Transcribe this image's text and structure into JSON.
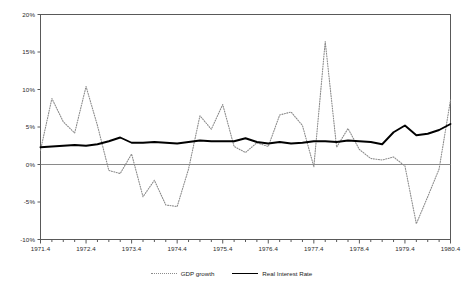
{
  "chart_data": {
    "type": "line",
    "title": "",
    "xlabel": "",
    "ylabel": "",
    "ylim": [
      -10,
      20
    ],
    "ytick_values": [
      -10,
      -5,
      0,
      5,
      10,
      15,
      20
    ],
    "ytick_labels": [
      "-10%",
      "-5%",
      "0%",
      "5%",
      "10%",
      "15%",
      "20%"
    ],
    "grid": false,
    "legend_position": "bottom-center",
    "zero_line": 0,
    "x": [
      "1971.4",
      "1972.1",
      "1972.2",
      "1972.3",
      "1972.4",
      "1973.1",
      "1973.2",
      "1973.3",
      "1973.4",
      "1974.1",
      "1974.2",
      "1974.3",
      "1974.4",
      "1975.1",
      "1975.2",
      "1975.3",
      "1975.4",
      "1976.1",
      "1976.2",
      "1976.3",
      "1976.4",
      "1977.1",
      "1977.2",
      "1977.3",
      "1977.4",
      "1978.1",
      "1978.2",
      "1978.3",
      "1978.4",
      "1979.1",
      "1979.2",
      "1979.3",
      "1979.4",
      "1980.1",
      "1980.2",
      "1980.3",
      "1980.4"
    ],
    "xtick_labels": [
      "1971.4",
      "1972.4",
      "1973.4",
      "1974.4",
      "1975.4",
      "1976.4",
      "1977.4",
      "1978.4",
      "1979.4",
      "1980.4"
    ],
    "xtick_positions": [
      0,
      4,
      8,
      12,
      16,
      20,
      24,
      28,
      32,
      36
    ],
    "series": [
      {
        "name": "GDP growth",
        "style": "dotted",
        "color": "#8c8c8c",
        "values": [
          1.9,
          8.8,
          5.7,
          4.2,
          10.4,
          5.2,
          -0.8,
          -1.2,
          1.4,
          -4.3,
          -2.1,
          -5.4,
          -5.6,
          -0.6,
          6.5,
          4.7,
          8.0,
          2.4,
          1.6,
          2.9,
          2.4,
          6.6,
          7.0,
          5.2,
          -0.3,
          16.4,
          2.3,
          4.8,
          2.0,
          0.8,
          0.6,
          1.0,
          -0.2,
          -7.9,
          -4.3,
          -0.6,
          8.6
        ]
      },
      {
        "name": "Real Interest Rate",
        "style": "solid",
        "color": "#000000",
        "values": [
          2.3,
          2.4,
          2.5,
          2.6,
          2.5,
          2.7,
          3.1,
          3.6,
          2.9,
          2.9,
          3.0,
          2.9,
          2.8,
          3.0,
          3.2,
          3.1,
          3.1,
          3.1,
          3.5,
          3.0,
          2.8,
          3.0,
          2.8,
          2.9,
          3.1,
          3.1,
          3.0,
          3.2,
          3.1,
          3.0,
          2.7,
          4.3,
          5.2,
          3.9,
          4.1,
          4.6,
          5.4
        ]
      }
    ]
  },
  "legend": {
    "entries": [
      {
        "label": "GDP growth"
      },
      {
        "label": "Real Interest Rate"
      }
    ]
  }
}
